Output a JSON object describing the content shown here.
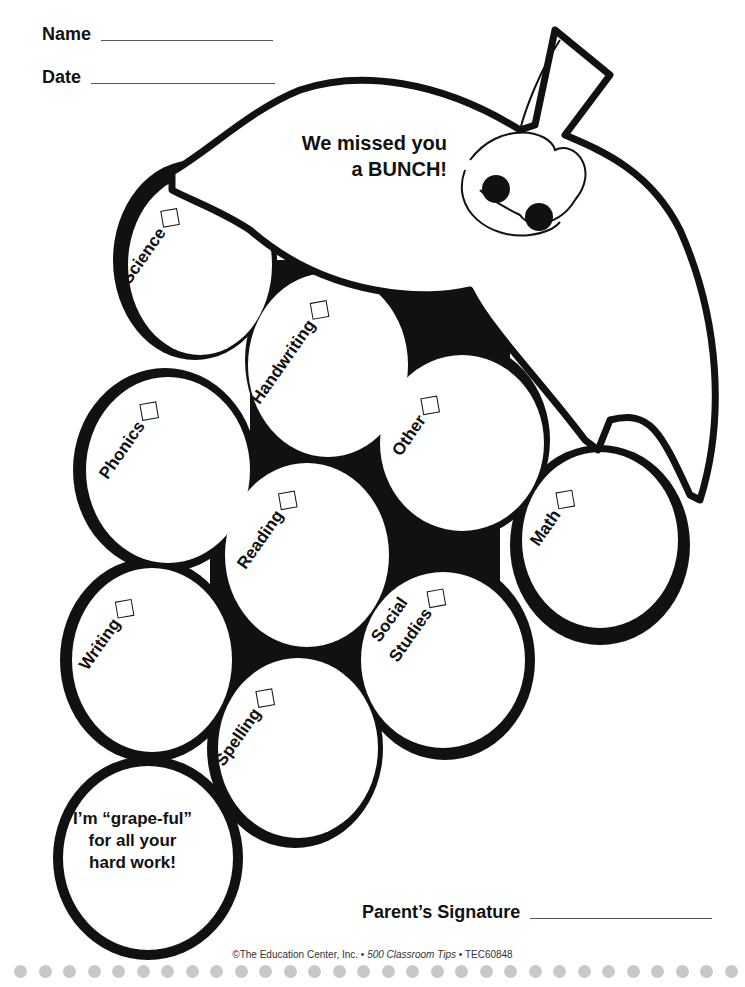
{
  "header": {
    "name_label": "Name",
    "date_label": "Date"
  },
  "headline": {
    "line1": "We missed you",
    "line2": "a BUNCH!"
  },
  "grapes": [
    {
      "label": "Science",
      "checked": false
    },
    {
      "label": "Handwriting",
      "checked": false
    },
    {
      "label": "Phonics",
      "checked": false
    },
    {
      "label": "Other",
      "checked": false
    },
    {
      "label": "Reading",
      "checked": false
    },
    {
      "label": "Math",
      "checked": false
    },
    {
      "label": "Writing",
      "checked": false
    },
    {
      "label": "Social",
      "label2": "Studies",
      "checked": false
    },
    {
      "label": "Spelling",
      "checked": false
    }
  ],
  "message": {
    "line1": "I’m “grape-ful”",
    "line2": "for all your",
    "line3": "hard work!"
  },
  "signature": {
    "label": "Parent’s Signature"
  },
  "footer": {
    "copyright": "©The Education Center, Inc. • ",
    "book": "500 Classroom Tips",
    "code": " • TEC60848"
  },
  "colors": {
    "ink": "#111111",
    "dots": "#c8c8c8"
  }
}
